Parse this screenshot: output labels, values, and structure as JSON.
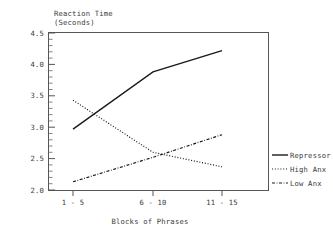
{
  "chart_data": {
    "type": "line",
    "title": "Reaction Time (Seconds)",
    "title_line1": "Reaction Time",
    "title_line2": "(Seconds)",
    "xlabel": "Blocks of Phrases",
    "ylabel": "Reaction Time (Seconds)",
    "categories": [
      "1 - 5",
      "6 - 10",
      "11 - 15"
    ],
    "ylim": [
      2.0,
      4.5
    ],
    "yticks": [
      2.0,
      2.5,
      3.0,
      3.5,
      4.0,
      4.5
    ],
    "ytick_labels": [
      "2.0",
      "2.5",
      "3.0",
      "3.5",
      "4.0",
      "4.5"
    ],
    "minor_tick_step": 0.1,
    "grid": false,
    "legend_position": "right",
    "series": [
      {
        "name": "Repressor",
        "style": "solid",
        "values": [
          2.97,
          3.88,
          4.22
        ]
      },
      {
        "name": "High Anx",
        "style": "dotted",
        "values": [
          3.43,
          2.6,
          2.37
        ]
      },
      {
        "name": "Low Anx",
        "style": "dashdot",
        "values": [
          2.13,
          2.52,
          2.88
        ]
      }
    ]
  },
  "legend": {
    "items": [
      {
        "label": "Repressor"
      },
      {
        "label": "High Anx"
      },
      {
        "label": "Low Anx"
      }
    ]
  },
  "colors": {
    "line": "#1a1a1a",
    "axis": "#555555",
    "text": "#3a3a3a",
    "background": "#ffffff"
  }
}
